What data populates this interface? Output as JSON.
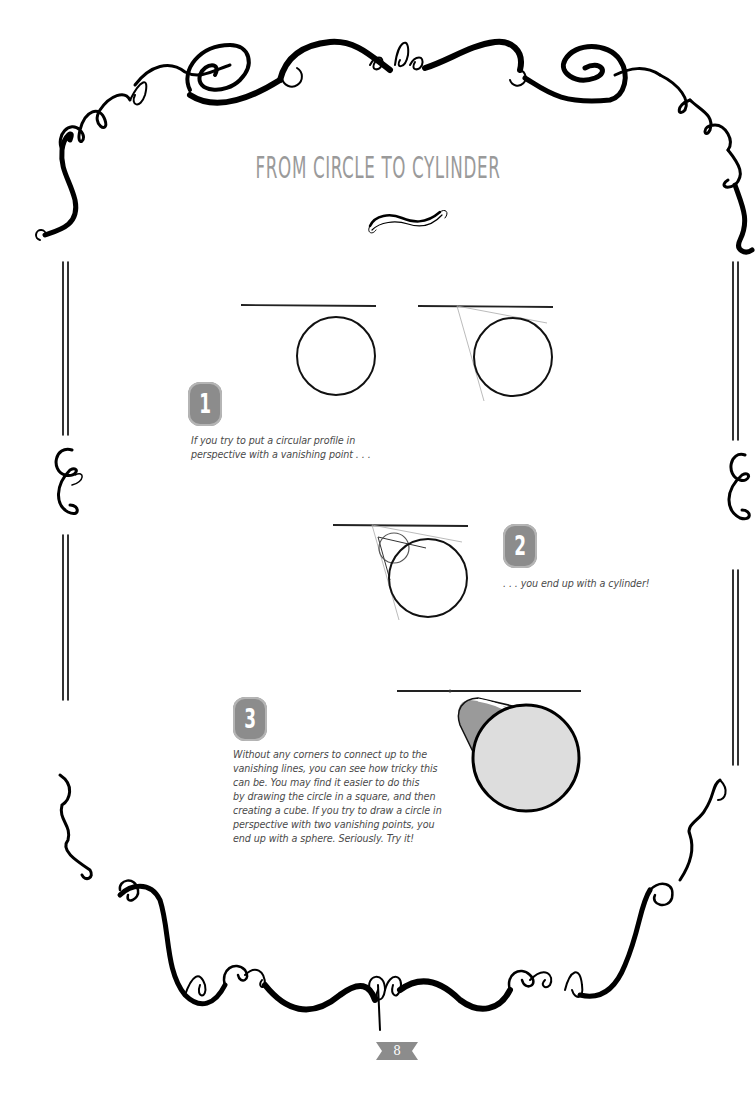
{
  "page": {
    "title": "FROM CIRCLE TO CYLINDER",
    "page_number": "8",
    "accent_color": "#8c8c8c",
    "title_color": "#9a9a9a"
  },
  "steps": [
    {
      "number": "1",
      "caption_lines": [
        "If you try to put a circular profile in",
        "perspective with a vanishing point . . ."
      ]
    },
    {
      "number": "2",
      "caption_lines": [
        ". . .  you end up with a cylinder!"
      ]
    },
    {
      "number": "3",
      "caption_lines": [
        "Without any corners to connect up to the",
        "vanishing lines, you can see how tricky this",
        "can be. You may find it easier to do this",
        "by drawing the circle in a square, and then",
        "creating a cube. If you try to draw a circle in",
        "perspective with two vanishing points, you",
        "end up with a sphere. Seriously. Try it!"
      ]
    }
  ],
  "illustrations": [
    {
      "name": "circle-with-horizon",
      "description": "circle below horizon line"
    },
    {
      "name": "circle-with-tangent-lines",
      "description": "circle with construction lines to vanishing point"
    },
    {
      "name": "circle-with-small-circle",
      "description": "large and small circle joined by tangents"
    },
    {
      "name": "shaded-cylinder",
      "description": "cylinder with grey shading"
    }
  ]
}
